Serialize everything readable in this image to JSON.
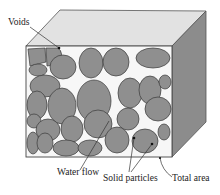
{
  "diagram": {
    "labels": {
      "voids": "Voids",
      "water_flow": "Water flow",
      "solid_particles": "Solid particles",
      "total_area": "Total area"
    },
    "colors": {
      "top_face": "#e2e2e2",
      "side_face": "#8c8c8c",
      "front_face_background": "#f7f7f7",
      "particle_fill": "#8f8f8f",
      "particle_stroke": "#3a3a3a",
      "outline": "#444444"
    }
  }
}
